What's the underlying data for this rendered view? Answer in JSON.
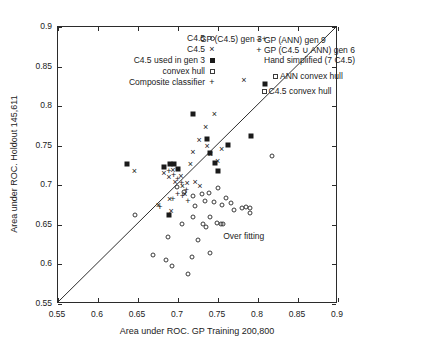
{
  "chart_data": {
    "type": "scatter",
    "title": "",
    "xlabel": "Area under ROC. GP Training 200,800",
    "ylabel": "Area under ROC. Holdout 145,611",
    "xlim": [
      0.55,
      0.9
    ],
    "ylim": [
      0.55,
      0.9
    ],
    "xticks": [
      "0.55",
      "0.6",
      "0.65",
      "0.7",
      "0.75",
      "0.8",
      "0.85",
      "0.9"
    ],
    "yticks": [
      "0.55",
      "0.6",
      "0.65",
      "0.7",
      "0.75",
      "0.8",
      "0.85",
      "0.9"
    ],
    "xtick_values": [
      0.55,
      0.6,
      0.65,
      0.7,
      0.75,
      0.8,
      0.85,
      0.9
    ],
    "ytick_values": [
      0.55,
      0.6,
      0.65,
      0.7,
      0.75,
      0.8,
      0.85,
      0.9
    ],
    "grid": false,
    "reference_line": {
      "name": "y = x diagonal",
      "from": [
        0.55,
        0.55
      ],
      "to": [
        0.9,
        0.9
      ]
    },
    "legend_position": "inside-top",
    "legend_left": [
      {
        "label": "C4.5",
        "marker": "circle"
      },
      {
        "label": "C4.5",
        "marker": "x"
      },
      {
        "label": "C4.5 used in gen 3",
        "marker": "square-filled"
      },
      {
        "label": "convex hull",
        "marker": "square-open"
      },
      {
        "label": "Composite classifier",
        "marker": "plus"
      }
    ],
    "legend_right": [
      {
        "label": "GP (ANN) gen 9",
        "marker": "plus"
      },
      {
        "label": "GP (C4.5 ∪ ANN) gen 6",
        "marker": "plus"
      },
      {
        "label": "Hand simplified (7 C4.5)",
        "marker": "none"
      },
      {
        "label": "ANN convex hull",
        "marker": "square-open"
      }
    ],
    "annotations": [
      {
        "text": "GP (C4.5) gen 3+",
        "x": 0.7275,
        "y": 0.8845,
        "marker": "none"
      },
      {
        "text": "C4.5 convex hull",
        "x": 0.8045,
        "y": 0.8195,
        "marker": "square-open"
      },
      {
        "text": "Over fitting",
        "x": 0.7565,
        "y": 0.6355,
        "marker": "none"
      }
    ],
    "series": [
      {
        "name": "C4.5",
        "marker": "circle",
        "points": [
          [
            0.6985,
            0.6975
          ],
          [
            0.7075,
            0.6915
          ],
          [
            0.7185,
            0.6865
          ],
          [
            0.7215,
            0.6735
          ],
          [
            0.7295,
            0.6885
          ],
          [
            0.7335,
            0.6805
          ],
          [
            0.7385,
            0.6905
          ],
          [
            0.7455,
            0.6795
          ],
          [
            0.7505,
            0.6965
          ],
          [
            0.7555,
            0.6745
          ],
          [
            0.7605,
            0.6845
          ],
          [
            0.7665,
            0.6775
          ],
          [
            0.7705,
            0.6685
          ],
          [
            0.7805,
            0.6715
          ],
          [
            0.7855,
            0.6725
          ],
          [
            0.7905,
            0.6715
          ],
          [
            0.7185,
            0.6605
          ],
          [
            0.7405,
            0.6595
          ],
          [
            0.7055,
            0.6515
          ],
          [
            0.7315,
            0.6505
          ],
          [
            0.7345,
            0.6475
          ],
          [
            0.7485,
            0.6525
          ],
          [
            0.7535,
            0.6515
          ],
          [
            0.7565,
            0.6505
          ],
          [
            0.6875,
            0.6345
          ],
          [
            0.7255,
            0.6305
          ],
          [
            0.6685,
            0.6125
          ],
          [
            0.6855,
            0.6055
          ],
          [
            0.6925,
            0.5985
          ],
          [
            0.7175,
            0.6095
          ],
          [
            0.7405,
            0.6145
          ],
          [
            0.7125,
            0.5885
          ],
          [
            0.8175,
            0.7375
          ],
          [
            0.7905,
            0.6655
          ],
          [
            0.6465,
            0.6625
          ]
        ]
      },
      {
        "name": "C4.5 (x)",
        "marker": "x",
        "points": [
          [
            0.6455,
            0.7175
          ],
          [
            0.6825,
            0.7155
          ],
          [
            0.6885,
            0.7105
          ],
          [
            0.6935,
            0.7195
          ],
          [
            0.6965,
            0.7045
          ],
          [
            0.7035,
            0.7115
          ],
          [
            0.7055,
            0.6985
          ],
          [
            0.7085,
            0.6895
          ],
          [
            0.7115,
            0.7025
          ],
          [
            0.7155,
            0.7275
          ],
          [
            0.7185,
            0.7425
          ],
          [
            0.7265,
            0.7575
          ],
          [
            0.7345,
            0.7735
          ],
          [
            0.7455,
            0.7905
          ],
          [
            0.7365,
            0.7495
          ],
          [
            0.7405,
            0.7395
          ],
          [
            0.7495,
            0.7305
          ],
          [
            0.7545,
            0.7455
          ],
          [
            0.6755,
            0.6755
          ],
          [
            0.6895,
            0.6825
          ],
          [
            0.7825,
            0.8335
          ],
          [
            0.7215,
            0.7045
          ],
          [
            0.7275,
            0.6985
          ],
          [
            0.6915,
            0.6675
          ]
        ]
      },
      {
        "name": "C4.5 used in gen 3",
        "marker": "square-filled",
        "points": [
          [
            0.6365,
            0.7265
          ],
          [
            0.6825,
            0.7235
          ],
          [
            0.6905,
            0.7265
          ],
          [
            0.6955,
            0.7265
          ],
          [
            0.7005,
            0.7205
          ],
          [
            0.7185,
            0.7895
          ],
          [
            0.7365,
            0.7585
          ],
          [
            0.7405,
            0.7405
          ],
          [
            0.7465,
            0.7285
          ],
          [
            0.7495,
            0.7175
          ],
          [
            0.7915,
            0.7625
          ],
          [
            0.6885,
            0.6625
          ],
          [
            0.8085,
            0.8285
          ],
          [
            0.7625,
            0.7505
          ]
        ]
      },
      {
        "name": "Composite classifier",
        "marker": "plus",
        "points": [
          [
            0.6885,
            0.7185
          ],
          [
            0.6945,
            0.7135
          ],
          [
            0.6995,
            0.7085
          ],
          [
            0.7045,
            0.7035
          ],
          [
            0.6995,
            0.6895
          ],
          [
            0.7055,
            0.6865
          ],
          [
            0.7105,
            0.6935
          ],
          [
            0.6935,
            0.6825
          ],
          [
            0.7125,
            0.6805
          ],
          [
            0.6775,
            0.6725
          ]
        ]
      }
    ]
  }
}
